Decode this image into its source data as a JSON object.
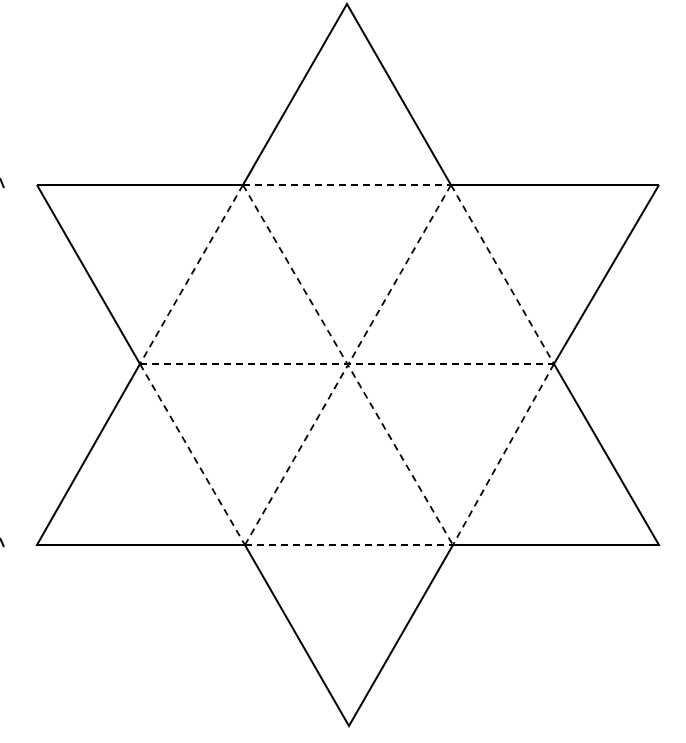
{
  "diagram": {
    "type": "hexagram-net",
    "colors": {
      "line": "#000000",
      "background": "#ffffff"
    },
    "vertices": {
      "top": [
        347,
        4
      ],
      "upper_left_outer": [
        37,
        185
      ],
      "upper_right_outer": [
        659,
        185
      ],
      "upper_left_inner": [
        243,
        185
      ],
      "upper_right_inner": [
        451,
        185
      ],
      "mid_left": [
        140,
        364
      ],
      "mid_right": [
        554,
        364
      ],
      "center": [
        347,
        364
      ],
      "lower_left_inner": [
        245,
        545
      ],
      "lower_right_inner": [
        453,
        545
      ],
      "lower_left_outer": [
        37,
        545
      ],
      "lower_right_outer": [
        659,
        545
      ],
      "bottom": [
        349,
        726
      ]
    },
    "edge_marks": [
      {
        "side": "left",
        "y": 185,
        "glyph": "partial-stroke"
      },
      {
        "side": "left",
        "y": 545,
        "glyph": "partial-stroke"
      }
    ]
  }
}
